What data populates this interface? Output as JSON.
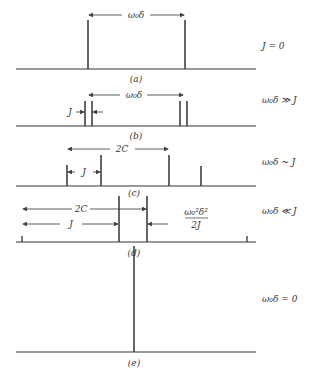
{
  "figure": {
    "panels": [
      {
        "id": "a",
        "caption": "(a)",
        "condition": "J = 0",
        "arrow_label": "ω₀δ"
      },
      {
        "id": "b",
        "caption": "(b)",
        "condition": "ω₀δ ≫ J",
        "arrow_label": "ω₀δ",
        "j_label": "J"
      },
      {
        "id": "c",
        "caption": "(c)",
        "condition": "ω₀δ ~ J",
        "arrow_label": "2C",
        "j_label": "J"
      },
      {
        "id": "d",
        "caption": "(d)",
        "condition": "ω₀δ ≪ J",
        "arrow_label": "2C",
        "j_label": "J",
        "frac_num": "ω₀²δ²",
        "frac_den": "2J"
      },
      {
        "id": "e",
        "caption": "(e)",
        "condition": "ω₀δ = 0"
      }
    ]
  }
}
